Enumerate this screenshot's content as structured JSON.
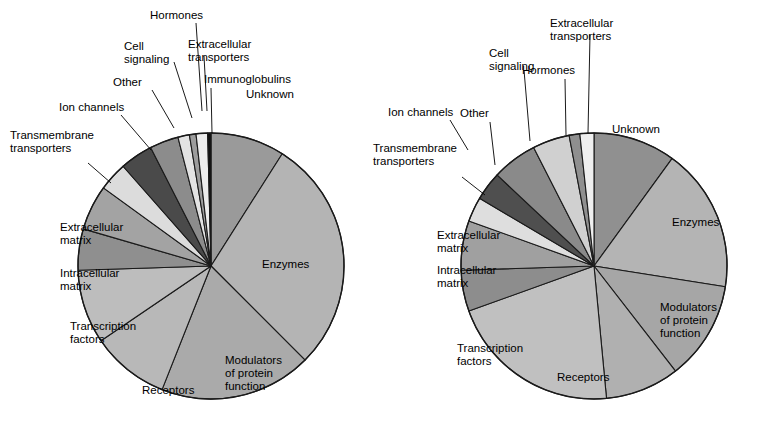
{
  "figure": {
    "background": "#ffffff",
    "outline_color": "#1a1a1a",
    "width": 772,
    "height": 445
  },
  "chart_data": [
    {
      "type": "pie",
      "name": "left-pie",
      "title": "",
      "center": [
        211,
        266
      ],
      "radius": 133,
      "start_angle_deg": -90,
      "direction": "clockwise",
      "legend": "none",
      "categories": [
        "Unknown",
        "Enzymes",
        "Modulators of protein function",
        "Receptors",
        "Transcription factors",
        "Intracellular matrix",
        "Extracellular matrix",
        "Transmembrane transporters",
        "Ion channels",
        "Other",
        "Cell signaling",
        "Hormones",
        "Extracellular transporters",
        "Immunoglobulins"
      ],
      "values": [
        9.0,
        28.5,
        18.5,
        9.5,
        9.0,
        5.0,
        5.5,
        3.5,
        4.0,
        3.5,
        1.4,
        0.8,
        1.4,
        0.4
      ],
      "colors": [
        "#9a9a9a",
        "#b4b4b4",
        "#aaaaaa",
        "#b8b8b8",
        "#bdbdbd",
        "#8f8f8f",
        "#a3a3a3",
        "#dcdcdc",
        "#4a4a4a",
        "#8c8c8c",
        "#e3e3e3",
        "#9c9c9c",
        "#ededed",
        "#111111"
      ],
      "labels_inside": [
        {
          "key": "Unknown",
          "text": "Unknown",
          "x": 246,
          "y": 98
        },
        {
          "key": "Enzymes",
          "text": "Enzymes",
          "x": 262,
          "y": 268
        },
        {
          "key": "Modulators of protein function",
          "lines": [
            "Modulators",
            "of protein",
            "function"
          ],
          "x": 225,
          "y": 364
        },
        {
          "key": "Receptors",
          "text": "Receptors",
          "x": 142,
          "y": 394
        },
        {
          "key": "Transcription factors",
          "lines": [
            "Transcription",
            "factors"
          ],
          "x": 70,
          "y": 330
        },
        {
          "key": "Intracellular matrix",
          "lines": [
            "Intracellular",
            "matrix"
          ],
          "x": 60,
          "y": 277
        },
        {
          "key": "Extracellular matrix",
          "lines": [
            "Extracellular",
            "matrix"
          ],
          "x": 60,
          "y": 231
        }
      ],
      "labels_outside": [
        {
          "key": "Transmembrane transporters",
          "lines": [
            "Transmembrane",
            "transporters"
          ],
          "x": 10,
          "y": 139,
          "anchor": "start",
          "leader": [
            [
              88,
              163
            ],
            [
              111,
              183
            ]
          ]
        },
        {
          "key": "Ion channels",
          "text": "Ion channels",
          "x": 59,
          "y": 111,
          "anchor": "start",
          "leader": [
            [
              121,
              115
            ],
            [
              151,
              150
            ]
          ]
        },
        {
          "key": "Other",
          "text": "Other",
          "x": 113,
          "y": 86,
          "anchor": "start",
          "leader": [
            [
              152,
              90
            ],
            [
              174,
              128
            ]
          ]
        },
        {
          "key": "Cell signaling",
          "lines": [
            "Cell",
            "signaling"
          ],
          "x": 124,
          "y": 50,
          "anchor": "start",
          "leader": [
            [
              174,
              62
            ],
            [
              192,
              118
            ]
          ]
        },
        {
          "key": "Hormones",
          "text": "Hormones",
          "x": 150,
          "y": 19,
          "anchor": "start",
          "leader": [
            [
              196,
              23
            ],
            [
              202,
              111
            ]
          ]
        },
        {
          "key": "Extracellular transporters",
          "lines": [
            "Extracellular",
            "transporters"
          ],
          "x": 188,
          "y": 48,
          "anchor": "start",
          "leader": [
            [
              204,
              56
            ],
            [
              207,
              111
            ]
          ]
        },
        {
          "key": "Immunoglobulins",
          "text": "Immunoglobulins",
          "x": 204,
          "y": 83,
          "anchor": "start",
          "leader": [
            [
              211,
              88
            ],
            [
              212,
              133
            ]
          ]
        }
      ]
    },
    {
      "type": "pie",
      "name": "right-pie",
      "title": "",
      "center": [
        594,
        266
      ],
      "radius": 133,
      "start_angle_deg": -90,
      "direction": "clockwise",
      "legend": "none",
      "categories": [
        "Unknown",
        "Enzymes",
        "Modulators of protein function",
        "Receptors",
        "Transcription factors",
        "Intracellular matrix",
        "Extracellular matrix",
        "Transmembrane transporters",
        "Ion channels",
        "Other",
        "Cell signaling",
        "Hormones",
        "Extracellular transporters"
      ],
      "values": [
        10.0,
        17.5,
        12.0,
        9.0,
        21.0,
        5.0,
        6.0,
        3.0,
        3.5,
        5.5,
        4.5,
        1.3,
        1.7
      ],
      "colors": [
        "#909090",
        "#b4b4b4",
        "#a6a6a6",
        "#b0b0b0",
        "#c0c0c0",
        "#8d8d8d",
        "#a0a0a0",
        "#dedede",
        "#4f4f4f",
        "#8a8a8a",
        "#d0d0d0",
        "#8f8f8f",
        "#efefef"
      ],
      "labels_inside": [
        {
          "key": "Unknown",
          "text": "Unknown",
          "x": 612,
          "y": 133
        },
        {
          "key": "Enzymes",
          "text": "Enzymes",
          "x": 672,
          "y": 226
        },
        {
          "key": "Modulators of protein function",
          "lines": [
            "Modulators",
            "of protein",
            "function"
          ],
          "x": 660,
          "y": 311
        },
        {
          "key": "Receptors",
          "text": "Receptors",
          "x": 557,
          "y": 381
        },
        {
          "key": "Transcription factors",
          "lines": [
            "Transcription",
            "factors"
          ],
          "x": 457,
          "y": 352
        },
        {
          "key": "Intracellular matrix",
          "lines": [
            "Intracellular",
            "matrix"
          ],
          "x": 437,
          "y": 274
        },
        {
          "key": "Extracellular matrix",
          "lines": [
            "Extracellular",
            "matrix"
          ],
          "x": 437,
          "y": 239
        }
      ],
      "labels_outside": [
        {
          "key": "Transmembrane transporters",
          "lines": [
            "Transmembrane",
            "transporters"
          ],
          "x": 373,
          "y": 152,
          "anchor": "start",
          "leader": [
            [
              462,
              177
            ],
            [
              485,
              195
            ]
          ]
        },
        {
          "key": "Ion channels",
          "text": "Ion channels",
          "x": 388,
          "y": 116,
          "anchor": "start",
          "leader": [
            [
              450,
              120
            ],
            [
              468,
              150
            ]
          ]
        },
        {
          "key": "Other",
          "text": "Other",
          "x": 460,
          "y": 117,
          "anchor": "start",
          "leader": [
            [
              490,
              122
            ],
            [
              495,
              165
            ]
          ]
        },
        {
          "key": "Cell signaling",
          "lines": [
            "Cell",
            "signaling"
          ],
          "x": 489,
          "y": 57,
          "anchor": "start",
          "leader": [
            [
              524,
              70
            ],
            [
              530,
              141
            ]
          ]
        },
        {
          "key": "Hormones",
          "text": "Hormones",
          "x": 522,
          "y": 74,
          "anchor": "start",
          "leader": [
            [
              565,
              79
            ],
            [
              566,
              135
            ]
          ]
        },
        {
          "key": "Extracellular transporters",
          "lines": [
            "Extracellular",
            "transporters"
          ],
          "x": 550,
          "y": 27,
          "anchor": "start",
          "leader": [
            [
              590,
              35
            ],
            [
              588,
              133
            ]
          ]
        }
      ]
    }
  ]
}
